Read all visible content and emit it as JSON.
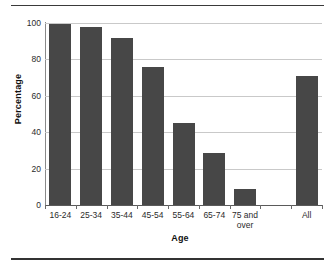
{
  "chart_data": {
    "type": "bar",
    "title": "",
    "xlabel": "Age",
    "ylabel": "Percentage",
    "categories": [
      "16-24",
      "25-34",
      "35-44",
      "45-54",
      "55-64",
      "65-74",
      "75 and over",
      "",
      "All"
    ],
    "values": [
      99.5,
      98,
      92,
      76,
      45,
      28.5,
      9,
      null,
      71
    ],
    "ylim": [
      0,
      100
    ],
    "yticks": [
      0,
      20,
      40,
      60,
      80,
      100
    ],
    "ytick_labels": [
      "0",
      "20",
      "40",
      "60",
      "80",
      "100"
    ],
    "grid": true,
    "legend": false,
    "bar_color": "#474747",
    "gridline_color": "#c9c9c9"
  },
  "figure": {
    "top_rule": "",
    "bottom_rule": ""
  }
}
